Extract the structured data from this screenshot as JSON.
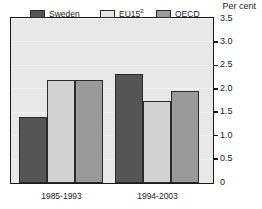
{
  "chart_data": {
    "type": "bar",
    "title": "",
    "axis_title": "Per cent",
    "xlabel": "",
    "ylabel": "Per cent",
    "categories": [
      "1985-1993",
      "1994-2003"
    ],
    "series": [
      {
        "name": "Sweden",
        "values": [
          1.4,
          2.33
        ],
        "color": "#555555"
      },
      {
        "name": "EU15",
        "name_superscript": "2",
        "values": [
          2.2,
          1.74
        ],
        "color": "#d2d2d2"
      },
      {
        "name": "OECD",
        "values": [
          2.2,
          1.97
        ],
        "color": "#9a9a9a"
      }
    ],
    "ylim": [
      0,
      3.5
    ],
    "ytick_values": [
      0,
      0.5,
      1.0,
      1.5,
      2.0,
      2.5,
      3.0,
      3.5
    ],
    "ytick_labels": [
      "0",
      "0.5",
      "1.0",
      "1.5",
      "2.0",
      "2.5",
      "3.0",
      "3.5"
    ],
    "grid": true,
    "legend_position": "top-inside",
    "plot_background": "#e8e8e8",
    "frame_color": "#1a1a1a"
  },
  "legend": {
    "items": [
      {
        "label": "Sweden",
        "sup": ""
      },
      {
        "label": "EU15",
        "sup": "2"
      },
      {
        "label": "OECD",
        "sup": ""
      }
    ]
  },
  "axis": {
    "title": "Per cent",
    "y_labels": [
      "3.5",
      "3.0",
      "2.5",
      "2.0",
      "1.5",
      "1.0",
      "0.5",
      "0"
    ],
    "x_labels": [
      "1985-1993",
      "1994-2003"
    ]
  }
}
